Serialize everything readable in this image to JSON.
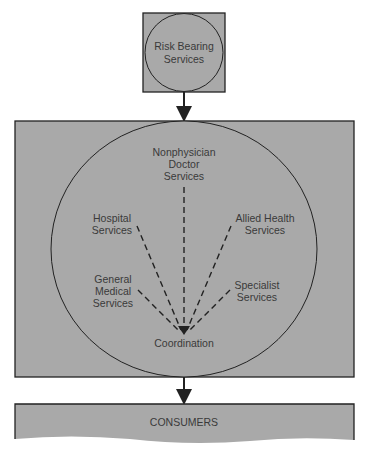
{
  "diagram": {
    "top_node": {
      "lines": [
        "Risk Bearing",
        "Services"
      ]
    },
    "center_node": {
      "label": "Coordination"
    },
    "service_nodes": [
      {
        "id": "nonphysician",
        "lines": [
          "Nonphysician",
          "Doctor",
          "Services"
        ]
      },
      {
        "id": "hospital",
        "lines": [
          "Hospital",
          "Services"
        ]
      },
      {
        "id": "allied",
        "lines": [
          "Allied Health",
          "Services"
        ]
      },
      {
        "id": "general",
        "lines": [
          "General",
          "Medical",
          "Services"
        ]
      },
      {
        "id": "specialist",
        "lines": [
          "Specialist",
          "Services"
        ]
      }
    ],
    "bottom_node": {
      "label": "CONSUMERS"
    },
    "colors": {
      "fill": "#a9a9a9",
      "stroke": "#222222",
      "text": "#3a3a3a",
      "background": "#ffffff"
    }
  }
}
